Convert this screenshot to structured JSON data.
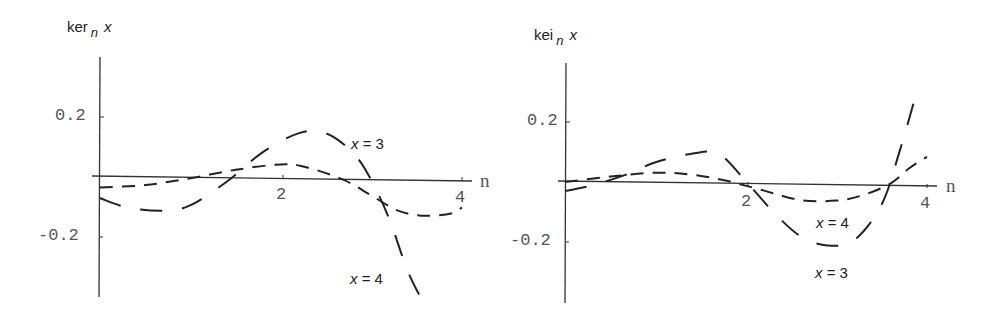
{
  "chart_data": [
    {
      "type": "line",
      "title": "",
      "ylabel": "ker_n x",
      "ylabel_parts": {
        "base": "ker",
        "sub": "n",
        "var": "x"
      },
      "xlabel": "n",
      "xlim": [
        0,
        4.1
      ],
      "ylim": [
        -0.4,
        0.4
      ],
      "x_ticks": [
        "2",
        "4"
      ],
      "y_ticks": [
        "0.2",
        "-0.2"
      ],
      "grid": false,
      "legend": "inline labels",
      "series": [
        {
          "name": "x = 3",
          "dash": "medium",
          "x": [
            0,
            0.5,
            1.0,
            1.5,
            2.0,
            2.3,
            2.7,
            3.0,
            3.3,
            3.6,
            3.9,
            4.0
          ],
          "values": [
            -0.035,
            -0.025,
            -0.0,
            0.03,
            0.05,
            0.04,
            0.0,
            -0.05,
            -0.1,
            -0.115,
            -0.105,
            -0.085
          ]
        },
        {
          "name": "x = 4",
          "dash": "long",
          "x": [
            0,
            0.3,
            0.7,
            1.0,
            1.4,
            1.8,
            2.2,
            2.5,
            2.8,
            3.0,
            3.2,
            3.4,
            3.6
          ],
          "values": [
            -0.07,
            -0.1,
            -0.11,
            -0.09,
            -0.01,
            0.09,
            0.155,
            0.155,
            0.09,
            0.0,
            -0.13,
            -0.3,
            -0.42
          ]
        }
      ],
      "annotations": [
        {
          "text_var": "x",
          "text_rest": "= 3"
        },
        {
          "text_var": "x",
          "text_rest": "= 4"
        }
      ]
    },
    {
      "type": "line",
      "title": "",
      "ylabel": "kei_n x",
      "ylabel_parts": {
        "base": "kei",
        "sub": "n",
        "var": "x"
      },
      "xlabel": "n",
      "xlim": [
        0,
        4.1
      ],
      "ylim": [
        -0.4,
        0.4
      ],
      "x_ticks": [
        "2",
        "4"
      ],
      "y_ticks": [
        "0.2",
        "-0.2"
      ],
      "grid": false,
      "legend": "inline labels",
      "series": [
        {
          "name": "x = 4",
          "dash": "medium",
          "x": [
            0,
            0.5,
            1.0,
            1.4,
            1.8,
            2.2,
            2.6,
            3.0,
            3.3,
            3.6,
            3.8,
            4.0
          ],
          "values": [
            0.0,
            0.02,
            0.035,
            0.03,
            0.01,
            -0.02,
            -0.05,
            -0.05,
            -0.03,
            0.01,
            0.06,
            0.1
          ]
        },
        {
          "name": "x = 3",
          "dash": "long",
          "x": [
            0,
            0.3,
            0.7,
            1.0,
            1.4,
            1.7,
            2.0,
            2.3,
            2.6,
            2.9,
            3.2,
            3.5,
            3.7,
            3.9
          ],
          "values": [
            -0.03,
            -0.01,
            0.03,
            0.07,
            0.1,
            0.1,
            0.01,
            -0.09,
            -0.17,
            -0.2,
            -0.18,
            -0.06,
            0.12,
            0.33
          ]
        }
      ],
      "annotations": [
        {
          "text_var": "x",
          "text_rest": "= 4"
        },
        {
          "text_var": "x",
          "text_rest": "= 3"
        }
      ]
    }
  ],
  "panels": {
    "left": {
      "ylabel": {
        "base": "ker",
        "sub": "n",
        "var": "x"
      },
      "x_axis_name": "n",
      "tick_x": [
        "2",
        "4"
      ],
      "tick_y": [
        "0.2",
        "-0.2"
      ],
      "labels": [
        {
          "var": "x",
          "rest": "= 3"
        },
        {
          "var": "x",
          "rest": "= 4"
        }
      ]
    },
    "right": {
      "ylabel": {
        "base": "kei",
        "sub": "n",
        "var": "x"
      },
      "x_axis_name": "n",
      "tick_x": [
        "2",
        "4"
      ],
      "tick_y": [
        "0.2",
        "-0.2"
      ],
      "labels": [
        {
          "var": "x",
          "rest": "= 4"
        },
        {
          "var": "x",
          "rest": "= 3"
        }
      ]
    }
  }
}
